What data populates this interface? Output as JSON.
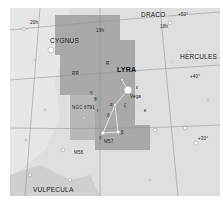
{
  "constellations": {
    "main": "LYRA",
    "neighbors": [
      "DRACO",
      "CYGNUS",
      "HERCULES",
      "VULPECULA"
    ]
  },
  "coordinates": {
    "ra": [
      "20h",
      "19h",
      "18h"
    ],
    "dec": [
      "+50°",
      "+40°",
      "+30°"
    ]
  },
  "stars": {
    "vega": "Vega",
    "greek": [
      "α",
      "β",
      "γ",
      "δ",
      "ε",
      "ζ",
      "η",
      "θ",
      "κ",
      "ι"
    ],
    "variable": [
      "R",
      "RR"
    ]
  },
  "objects": [
    "M57",
    "M56",
    "NGC 6791"
  ],
  "colors": {
    "background": "#dcdcdc",
    "constellation_area": "#a8a8a8",
    "milky_way": "#c2c2c2",
    "grid": "#888888"
  }
}
